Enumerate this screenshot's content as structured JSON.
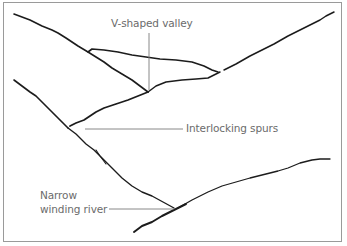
{
  "diagram": {
    "type": "landform-sketch",
    "labels": {
      "v_valley": "V-shaped valley",
      "spurs": "Interlocking spurs",
      "river_line1": "Narrow",
      "river_line2": "winding river"
    },
    "colors": {
      "line": "#1c1c1c",
      "label_text": "#6b6b6b",
      "leader": "#7a7a7a",
      "frame": "#9a9a9a",
      "background": "#ffffff"
    }
  }
}
